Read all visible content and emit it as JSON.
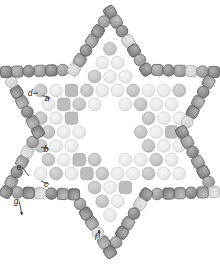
{
  "figure": {
    "background_color": "#ffffff",
    "width": 220,
    "height": 264,
    "center": [
      110,
      132
    ]
  },
  "palette": {
    "shell_dark_fill": "#8c8c8c",
    "shell_dark_stroke": "#5a5a5a",
    "shell_mid_fill": "#a0a0a0",
    "shell_mid_stroke": "#6e6e6e",
    "shell_light_fill": "#d8d8d8",
    "shell_light_stroke": "#b0b0b0",
    "core_light_fill": "#ececec",
    "core_light_stroke": "#cdcdcd",
    "core_mid_fill": "#c6c6c6",
    "core_mid_stroke": "#ababab",
    "core_square_fill": "#bdbdbd",
    "core_square_stroke": "#a2a2a2",
    "dash_line": "#8a8a8a",
    "label_color": "#202020",
    "leader_color": "#1a1a1a"
  },
  "labels": [
    {
      "id": "a",
      "text": "a",
      "x": 47,
      "y": 101,
      "leader_to": [
        42.5,
        95.5
      ]
    },
    {
      "id": "b",
      "text": "b",
      "x": 46,
      "y": 152,
      "leader_to": [
        41,
        147
      ]
    },
    {
      "id": "c",
      "text": "c",
      "x": 46,
      "y": 187,
      "leader_to": [
        41,
        181
      ]
    },
    {
      "id": "d",
      "text": "d",
      "x": 30,
      "y": 96,
      "leader_to": [
        38,
        93
      ]
    },
    {
      "id": "e",
      "text": "e",
      "x": 19,
      "y": 170,
      "leader_to": [
        29,
        176
      ]
    },
    {
      "id": "f",
      "text": "f",
      "x": 96,
      "y": 240,
      "leader_to": [
        99,
        230
      ],
      "arrow": true
    },
    {
      "id": "g",
      "text": "g",
      "x": 16,
      "y": 204,
      "leader_to": [
        22,
        215
      ],
      "arrow": true
    }
  ],
  "legend_note": "Labels a-g mark structural features of the star shell",
  "shell_ring": {
    "description": "Outer shell of alternating rounded-square and circular subunits tracing a six-pointed star outline",
    "unit_count": 72,
    "point_count": 6,
    "outer_radius": 120,
    "inner_radius": 72
  },
  "core_lattice": {
    "description": "Interior hexagonal lattice of light circles, mid-gray circles and rounded squares",
    "unit_count": 96,
    "hollow_center_radius": 30
  },
  "threads": {
    "description": "Dashed threading paths running through the shell subunits",
    "style": "dashed",
    "dash_pattern": "2 2"
  }
}
